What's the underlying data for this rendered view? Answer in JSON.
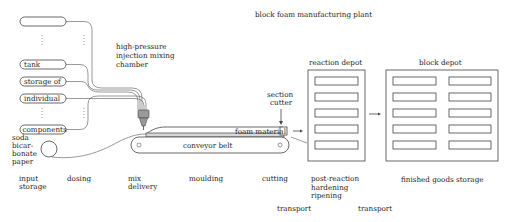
{
  "title": "block foam manufacturing plant",
  "tanks": [
    {
      "label": ""
    },
    {
      "label": "tank"
    },
    {
      "label": "storage of"
    },
    {
      "label": "individual"
    },
    {
      "label": "components"
    }
  ],
  "mixing_chamber": {
    "label_lines": [
      "high-pressure",
      "injection mixing",
      "chamber"
    ]
  },
  "paper_roll": {
    "label_lines": [
      "soda",
      "bicar-",
      "bonate",
      "paper"
    ]
  },
  "conveyor": {
    "label": "conveyor belt"
  },
  "foam": {
    "label": "foam material"
  },
  "cutter": {
    "label_lines": [
      "section",
      "cutter"
    ]
  },
  "reaction_depot": {
    "label": "reaction depot",
    "slots": 5
  },
  "block_depot": {
    "label": "block depot",
    "slots_per_column": 5,
    "columns": 2
  },
  "stages": [
    {
      "lines": [
        "input",
        "storage"
      ]
    },
    {
      "lines": [
        "dosing"
      ]
    },
    {
      "lines": [
        "mix",
        "delivery"
      ]
    },
    {
      "lines": [
        "moulding"
      ]
    },
    {
      "lines": [
        "cutting"
      ]
    },
    {
      "lines": [
        "post-reaction",
        "hardening",
        "ripening"
      ]
    },
    {
      "lines": [
        "finished goods storage"
      ]
    }
  ],
  "transports": [
    {
      "label": "transport"
    },
    {
      "label": "transport"
    }
  ]
}
